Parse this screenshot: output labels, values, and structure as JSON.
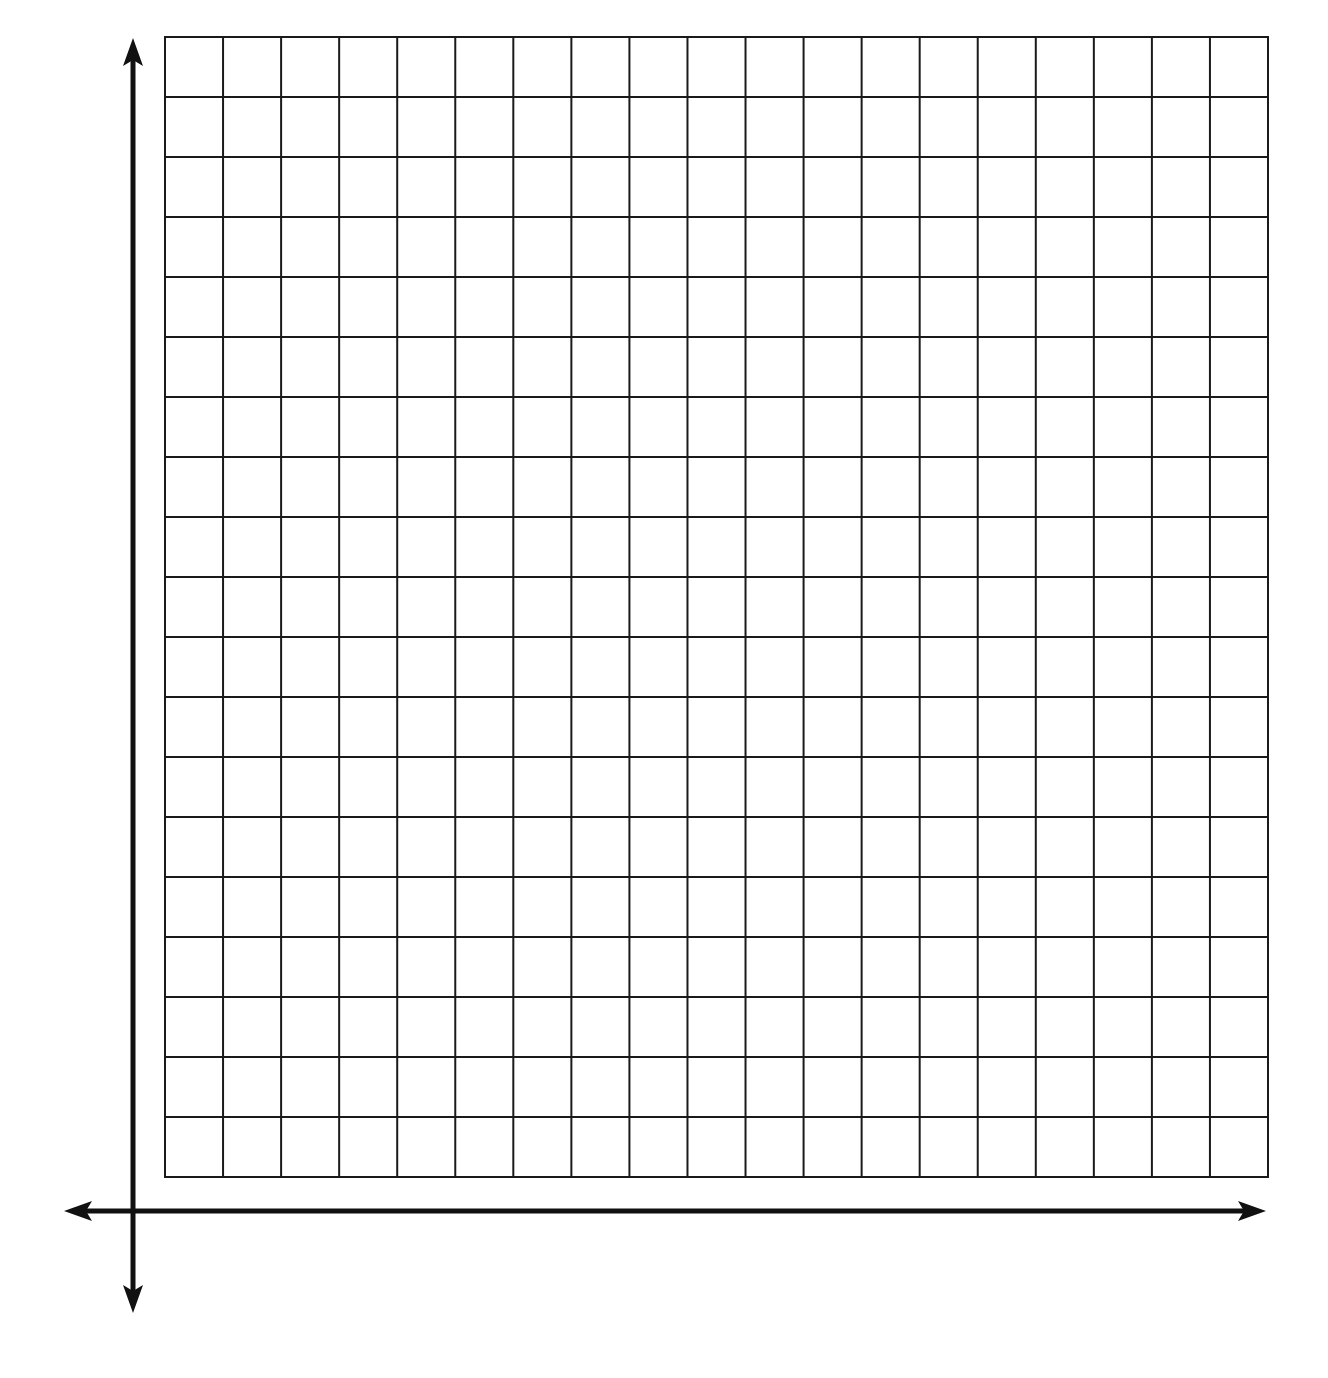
{
  "chart_data": {
    "type": "grid",
    "title": "",
    "xlabel": "",
    "ylabel": "",
    "grid": true,
    "grid_columns": 19,
    "grid_rows": 19,
    "x_ticks": [],
    "y_ticks": [],
    "series": [],
    "axes": {
      "x_axis": {
        "arrows": [
          "left",
          "right"
        ]
      },
      "y_axis": {
        "arrows": [
          "up",
          "down"
        ]
      }
    },
    "legend": null
  },
  "colors": {
    "grid_line": "#1a1a1a",
    "axis_line": "#111111",
    "background": "#ffffff"
  },
  "layout": {
    "grid_left": 165,
    "grid_top": 37,
    "grid_right": 1268,
    "grid_bottom": 1177,
    "origin_x": 133,
    "origin_y": 1211,
    "x_axis_left": 64,
    "x_axis_right": 1266,
    "y_axis_top": 38,
    "y_axis_bottom": 1313
  }
}
